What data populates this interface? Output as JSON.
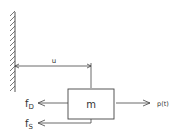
{
  "diagram": {
    "type": "sdof-free-body",
    "mass_label": "m",
    "displacement_label": "u",
    "applied_force_label": "p(t)",
    "damping_force_label": {
      "base": "f",
      "sub": "D"
    },
    "spring_force_label": {
      "base": "f",
      "sub": "S"
    },
    "colors": {
      "line": "#444444",
      "text": "#333333",
      "background": "#ffffff"
    }
  }
}
